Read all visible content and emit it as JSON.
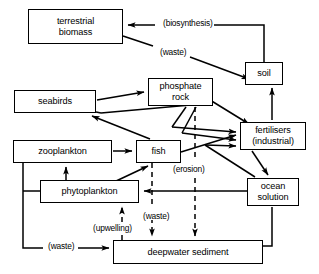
{
  "diagram": {
    "type": "flow-diagram",
    "background_color": "#ffffff",
    "stroke_color": "#000000",
    "nodes": [
      {
        "id": "terrestrial_biomass",
        "label": "terrestrial\nbiomass",
        "x": 28,
        "y": 9,
        "w": 95,
        "h": 35
      },
      {
        "id": "soil",
        "label": "soil",
        "x": 245,
        "y": 62,
        "w": 38,
        "h": 23
      },
      {
        "id": "phosphate_rock",
        "label": "phosphate\nrock",
        "x": 148,
        "y": 78,
        "w": 65,
        "h": 28
      },
      {
        "id": "seabirds",
        "label": "seabirds",
        "x": 14,
        "y": 90,
        "w": 82,
        "h": 23
      },
      {
        "id": "fertilisers",
        "label": "fertilisers\n(industrial)",
        "x": 240,
        "y": 122,
        "w": 66,
        "h": 28
      },
      {
        "id": "zooplankton",
        "label": "zooplankton",
        "x": 13,
        "y": 140,
        "w": 99,
        "h": 23
      },
      {
        "id": "fish",
        "label": "fish",
        "x": 136,
        "y": 140,
        "w": 45,
        "h": 23
      },
      {
        "id": "phytoplankton",
        "label": "phytoplankton",
        "x": 40,
        "y": 180,
        "w": 99,
        "h": 23
      },
      {
        "id": "ocean_solution",
        "label": "ocean\nsolution",
        "x": 247,
        "y": 178,
        "w": 52,
        "h": 28
      },
      {
        "id": "deepwater_sediment",
        "label": "deepwater sediment",
        "x": 113,
        "y": 240,
        "w": 150,
        "h": 24
      }
    ],
    "edge_labels": [
      {
        "id": "biosynthesis",
        "text": "(biosynthesis)",
        "x": 162,
        "y": 19
      },
      {
        "id": "waste_terrestrial",
        "text": "(waste)",
        "x": 159,
        "y": 48
      },
      {
        "id": "erosion",
        "text": "(erosion)",
        "x": 172,
        "y": 165
      },
      {
        "id": "waste_fish",
        "text": "(waste)",
        "x": 142,
        "y": 212
      },
      {
        "id": "upwelling",
        "text": "(upwelling)",
        "x": 92,
        "y": 224
      },
      {
        "id": "waste_zooplankton",
        "text": "(waste)",
        "x": 47,
        "y": 242
      }
    ],
    "edges": [
      {
        "from": "soil",
        "to": "terrestrial_biomass",
        "label": "(biosynthesis)",
        "style": "solid"
      },
      {
        "from": "terrestrial_biomass",
        "to": "soil",
        "label": "(waste)",
        "style": "solid"
      },
      {
        "from": "soil",
        "to": "fertilisers",
        "style": "solid"
      },
      {
        "from": "fertilisers",
        "to": "soil",
        "style": "solid"
      },
      {
        "from": "seabirds",
        "to": "phosphate_rock",
        "style": "solid"
      },
      {
        "from": "phosphate_rock",
        "to": "seabirds",
        "style": "solid"
      },
      {
        "from": "phosphate_rock",
        "to": "fertilisers",
        "style": "solid"
      },
      {
        "from": "phosphate_rock",
        "to": "deepwater_sediment",
        "label": "(erosion)",
        "style": "dashed"
      },
      {
        "from": "fish",
        "to": "seabirds",
        "style": "solid"
      },
      {
        "from": "zooplankton",
        "to": "fish",
        "style": "solid"
      },
      {
        "from": "phytoplankton",
        "to": "zooplankton",
        "style": "solid"
      },
      {
        "from": "phytoplankton",
        "to": "fish",
        "style": "solid"
      },
      {
        "from": "fish",
        "to": "fertilisers",
        "style": "solid"
      },
      {
        "from": "fish",
        "to": "deepwater_sediment",
        "label": "(waste)",
        "style": "dashed"
      },
      {
        "from": "ocean_solution",
        "to": "phytoplankton",
        "style": "solid"
      },
      {
        "from": "ocean_solution",
        "to": "fertilisers",
        "style": "solid"
      },
      {
        "from": "fertilisers",
        "to": "ocean_solution",
        "style": "solid"
      },
      {
        "from": "deepwater_sediment",
        "to": "phytoplankton",
        "label": "(upwelling)",
        "style": "dashed"
      },
      {
        "from": "zooplankton",
        "to": "deepwater_sediment",
        "label": "(waste)",
        "style": "solid"
      },
      {
        "from": "deepwater_sediment",
        "to": "ocean_solution",
        "style": "solid"
      }
    ]
  }
}
